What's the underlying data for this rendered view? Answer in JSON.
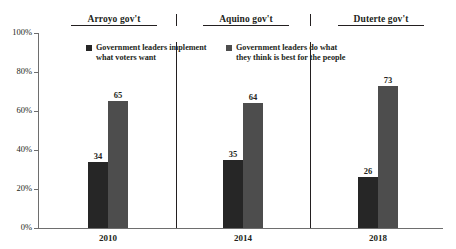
{
  "chart_data": {
    "type": "bar",
    "title": "",
    "xlabel": "",
    "ylabel": "",
    "categories": [
      "2010",
      "2014",
      "2018"
    ],
    "ylim": [
      0,
      100
    ],
    "ytick_labels": [
      "0%",
      "20%",
      "40%",
      "60%",
      "80%",
      "100%"
    ],
    "ytick_values": [
      0,
      20,
      40,
      60,
      80,
      100
    ],
    "grid": false,
    "legend_position": "top",
    "series": [
      {
        "name": "Government leaders implement what voters want",
        "name_line1": "Government leaders implement",
        "name_line2": "what voters want",
        "color": "#262626",
        "values": [
          34,
          35,
          26
        ]
      },
      {
        "name": "Government leaders do what they think is best for the people",
        "name_line1": "Government leaders do what",
        "name_line2": "they think is best for the people",
        "color": "#4d4d4d",
        "values": [
          65,
          64,
          73
        ]
      }
    ],
    "group_headers": [
      "Arroyo gov't",
      "Aquino gov't",
      "Duterte gov't"
    ],
    "annotations": {
      "axis_color": "#6e6e6e",
      "text_color": "#231f20"
    }
  }
}
